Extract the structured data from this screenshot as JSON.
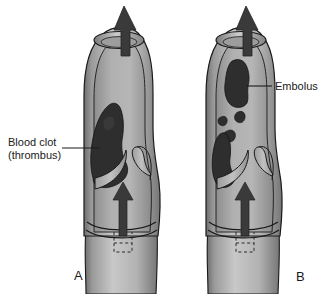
{
  "figure": {
    "background_color": "#ffffff"
  },
  "colors": {
    "vessel_lumen": "#a9a9a9",
    "vessel_wall_light": "#c6c6c6",
    "vessel_wall_shadow": "#7d7d7d",
    "outline": "#1a1a1a",
    "clot_fill": "#2e2e2e",
    "arrow_fill": "#3a3a3a",
    "label_text": "#1a1a1a",
    "leader_line": "#1a1a1a"
  },
  "labels": {
    "thrombus": "Blood clot\n(thrombus)",
    "embolus": "Embolus"
  },
  "panels": [
    {
      "letter": "A",
      "name": "thrombus-panel"
    },
    {
      "letter": "B",
      "name": "embolus-panel"
    }
  ],
  "icons": {
    "blood_flow_arrow": "up-arrow-icon",
    "outflow_arrow": "up-arrow-icon",
    "leader": "leader-line"
  }
}
